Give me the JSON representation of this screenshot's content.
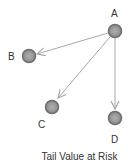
{
  "diagram": {
    "caption": "Tail Value at Risk",
    "nodes": [
      {
        "id": "A",
        "label": "A",
        "x": 115,
        "y": 31
      },
      {
        "id": "B",
        "label": "B",
        "x": 29,
        "y": 56
      },
      {
        "id": "C",
        "label": "C",
        "x": 52,
        "y": 107
      },
      {
        "id": "D",
        "label": "D",
        "x": 115,
        "y": 118
      }
    ],
    "edges": [
      {
        "from": "A",
        "to": "B"
      },
      {
        "from": "A",
        "to": "C"
      },
      {
        "from": "A",
        "to": "D"
      }
    ],
    "colors": {
      "node_fill": "#9a9a9a",
      "node_stroke": "#6e6e6e",
      "edge": "#a8a8a8",
      "text": "#333333"
    }
  }
}
